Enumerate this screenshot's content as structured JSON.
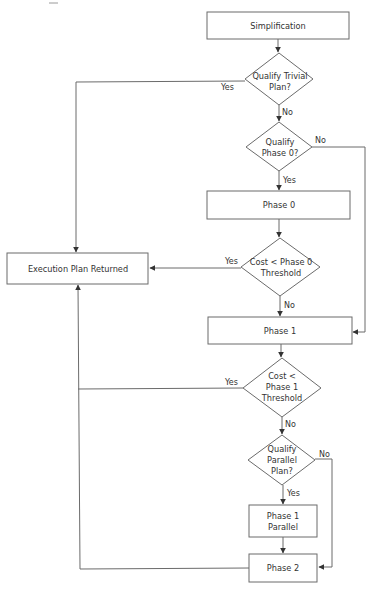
{
  "diagram": {
    "type": "flowchart",
    "title": "",
    "colors": {
      "stroke": "#6b6b6b",
      "text": "#333333",
      "background": "#ffffff"
    },
    "nodes": {
      "simplification": {
        "shape": "process",
        "lines": [
          "Simplification"
        ]
      },
      "qualify_trivial": {
        "shape": "decision",
        "lines": [
          "Qualify Trivial",
          "Plan?"
        ]
      },
      "qualify_phase0": {
        "shape": "decision",
        "lines": [
          "Qualify",
          "Phase 0?"
        ]
      },
      "phase0": {
        "shape": "process",
        "lines": [
          "Phase 0"
        ]
      },
      "cost_phase0": {
        "shape": "decision",
        "lines": [
          "Cost < Phase 0",
          "Threshold"
        ]
      },
      "execution_plan": {
        "shape": "process",
        "lines": [
          "Execution Plan Returned"
        ]
      },
      "phase1": {
        "shape": "process",
        "lines": [
          "Phase 1"
        ]
      },
      "cost_phase1": {
        "shape": "decision",
        "lines": [
          "Cost <",
          "Phase 1",
          "Threshold"
        ]
      },
      "qualify_parallel": {
        "shape": "decision",
        "lines": [
          "Qualify",
          "Parallel",
          "Plan?"
        ]
      },
      "phase1_parallel": {
        "shape": "process",
        "lines": [
          "Phase 1",
          "Parallel"
        ]
      },
      "phase2": {
        "shape": "process",
        "lines": [
          "Phase 2"
        ]
      }
    },
    "edge_labels": {
      "trivial_yes": "Yes",
      "trivial_no": "No",
      "phase0q_no": "No",
      "phase0q_yes": "Yes",
      "cost0_yes": "Yes",
      "cost0_no": "No",
      "cost1_yes": "Yes",
      "cost1_no": "No",
      "parallel_no": "No",
      "parallel_yes": "Yes"
    },
    "edges": [
      {
        "from": "simplification",
        "to": "qualify_trivial",
        "label": ""
      },
      {
        "from": "qualify_trivial",
        "to": "execution_plan",
        "label": "Yes"
      },
      {
        "from": "qualify_trivial",
        "to": "qualify_phase0",
        "label": "No"
      },
      {
        "from": "qualify_phase0",
        "to": "phase1",
        "label": "No"
      },
      {
        "from": "qualify_phase0",
        "to": "phase0",
        "label": "Yes"
      },
      {
        "from": "phase0",
        "to": "cost_phase0",
        "label": ""
      },
      {
        "from": "cost_phase0",
        "to": "execution_plan",
        "label": "Yes"
      },
      {
        "from": "cost_phase0",
        "to": "phase1",
        "label": "No"
      },
      {
        "from": "phase1",
        "to": "cost_phase1",
        "label": ""
      },
      {
        "from": "cost_phase1",
        "to": "execution_plan",
        "label": "Yes"
      },
      {
        "from": "cost_phase1",
        "to": "qualify_parallel",
        "label": "No"
      },
      {
        "from": "qualify_parallel",
        "to": "phase2",
        "label": "No"
      },
      {
        "from": "qualify_parallel",
        "to": "phase1_parallel",
        "label": "Yes"
      },
      {
        "from": "phase1_parallel",
        "to": "phase2",
        "label": ""
      },
      {
        "from": "phase2",
        "to": "execution_plan",
        "label": ""
      }
    ]
  }
}
